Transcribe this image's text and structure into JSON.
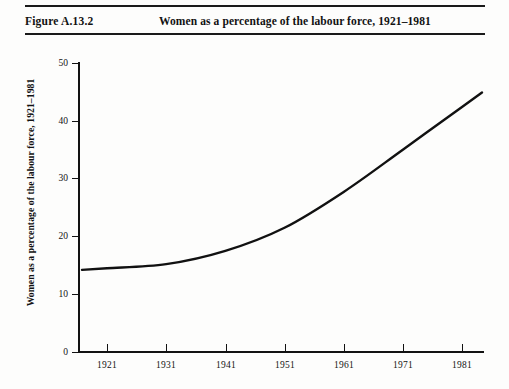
{
  "caption": {
    "figure_number": "Figure A.13.2",
    "title": "Women as a percentage of the labour force, 1921–1981"
  },
  "colors": {
    "ink": "#121212",
    "paper": "#fdfdfc",
    "curve": "#111111"
  },
  "axes": {
    "y_title": "Women as a percentage of the labour force, 1921–1981",
    "y_ticks": [
      "0",
      "10",
      "20",
      "30",
      "40",
      "50"
    ],
    "x_ticks": [
      "1921",
      "1931",
      "1941",
      "1951",
      "1961",
      "1971",
      "1981"
    ]
  },
  "chart_data": {
    "type": "line",
    "title": "Women as a percentage of the labour force, 1921–1981",
    "xlabel": "",
    "ylabel": "Women as a percentage of the labour force, 1921–1981",
    "xlim": [
      1919,
      1984
    ],
    "ylim": [
      0,
      50
    ],
    "ytick_values": [
      0,
      10,
      20,
      30,
      40,
      50
    ],
    "xtick_values": [
      1921,
      1931,
      1941,
      1951,
      1961,
      1971,
      1981
    ],
    "grid": false,
    "legend": "none",
    "series": [
      {
        "name": "Women as a percentage of the labour force",
        "x": [
          1921,
          1931,
          1941,
          1951,
          1961,
          1971,
          1981
        ],
        "values": [
          14.5,
          15.2,
          17.5,
          21.5,
          27.7,
          35.0,
          42.4
        ]
      }
    ]
  }
}
